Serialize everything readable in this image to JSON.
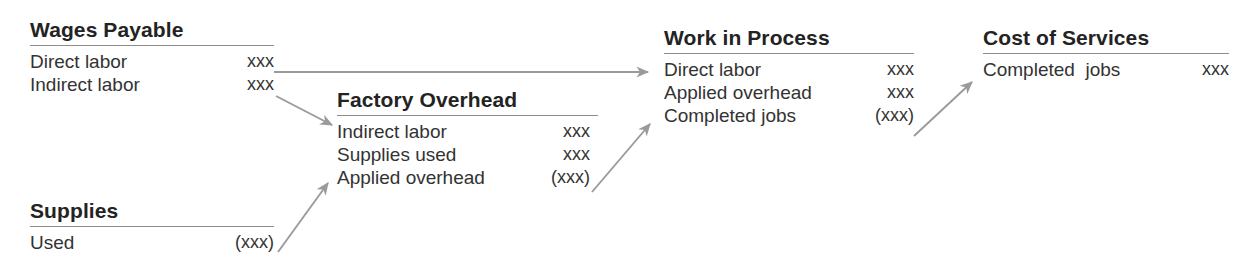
{
  "diagram": {
    "accent_color": "#9a9a9a",
    "text_color": "#333333",
    "rule_color": "#8d8d8d",
    "accounts": [
      {
        "id": "wages-payable",
        "title": "Wages Payable",
        "rows": [
          {
            "label": "Direct labor",
            "value": "xxx"
          },
          {
            "label": "Indirect labor",
            "value": "xxx"
          }
        ]
      },
      {
        "id": "supplies",
        "title": "Supplies",
        "rows": [
          {
            "label": "Used",
            "value": "(xxx)"
          }
        ]
      },
      {
        "id": "factory-overhead",
        "title": "Factory Overhead",
        "rows": [
          {
            "label": "Indirect labor",
            "value": "xxx"
          },
          {
            "label": "Supplies used",
            "value": "xxx"
          },
          {
            "label": "Applied overhead",
            "value": "(xxx)"
          }
        ]
      },
      {
        "id": "work-in-process",
        "title": "Work in Process",
        "rows": [
          {
            "label": "Direct labor",
            "value": "xxx"
          },
          {
            "label": "Applied overhead",
            "value": "xxx"
          },
          {
            "label": "Completed jobs",
            "value": "(xxx)"
          }
        ]
      },
      {
        "id": "cost-of-services",
        "title": "Cost of Services",
        "rows": [
          {
            "label": "Completed  jobs",
            "value": "xxx"
          }
        ]
      }
    ],
    "flows": [
      {
        "id": "direct-labor-to-wip",
        "from": "wages-payable",
        "to": "work-in-process"
      },
      {
        "id": "indirect-labor-to-overhead",
        "from": "wages-payable",
        "to": "factory-overhead"
      },
      {
        "id": "supplies-used-to-overhead",
        "from": "supplies",
        "to": "factory-overhead"
      },
      {
        "id": "applied-overhead-to-wip",
        "from": "factory-overhead",
        "to": "work-in-process"
      },
      {
        "id": "completed-jobs-to-cost-of-services",
        "from": "work-in-process",
        "to": "cost-of-services"
      }
    ]
  }
}
